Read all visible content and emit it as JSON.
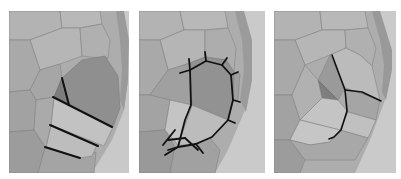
{
  "figure": {
    "panels": [
      {
        "id": "panel-1",
        "label": "edge loops across concha",
        "x": 9,
        "y": 11,
        "w": 120,
        "h": 162
      },
      {
        "id": "panel-2",
        "label": "edge loop around concha rim",
        "x": 139,
        "y": 11,
        "w": 126,
        "h": 162
      },
      {
        "id": "panel-3",
        "label": "concha cavity extrusion",
        "x": 274,
        "y": 11,
        "w": 122,
        "h": 162
      }
    ],
    "colors": {
      "background": "#ffffff",
      "mesh_light": "#b4b4b4",
      "mesh_mid": "#a0a0a0",
      "mesh_dark": "#8a8a8a",
      "wire": "#7a7a7a",
      "highlight_edges": "#111111",
      "backdrop": "#c8c8c8"
    }
  }
}
